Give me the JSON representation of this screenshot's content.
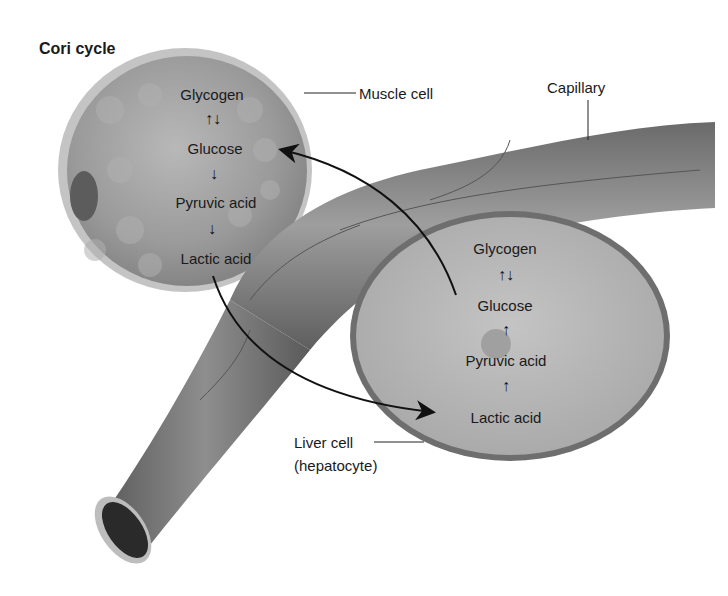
{
  "title": "Cori cycle",
  "labels": {
    "muscle_cell": "Muscle cell",
    "capillary": "Capillary",
    "liver_cell_line1": "Liver cell",
    "liver_cell_line2": "(hepatocyte)"
  },
  "muscle_cell": {
    "steps": [
      "Glycogen",
      "Glucose",
      "Pyruvic acid",
      "Lactic acid"
    ],
    "arrows": [
      "↑↓",
      "↓",
      "↓"
    ]
  },
  "liver_cell": {
    "steps": [
      "Glycogen",
      "Glucose",
      "Pyruvic acid",
      "Lactic acid"
    ],
    "arrows": [
      "↑↓",
      "↑",
      "↑"
    ]
  },
  "flows": [
    {
      "from": "muscle_cell.Lactic acid",
      "to": "liver_cell.Lactic acid"
    },
    {
      "from": "liver_cell.Glucose",
      "to": "muscle_cell.Glucose"
    }
  ],
  "colors": {
    "cell_fill": "#9a9a9a",
    "cell_rim": "#c2c2c2",
    "liver_fill": "#b4b4b4",
    "liver_rim": "#6e6e6e",
    "capillary": "#7c7c7c",
    "arrow": "#111111"
  }
}
